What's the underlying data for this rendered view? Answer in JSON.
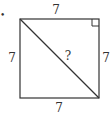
{
  "diagram": {
    "shape": "square",
    "sides": {
      "top": "7",
      "left": "7",
      "right": "7",
      "bottom": "7"
    },
    "diagonal_label": "?",
    "right_angle_marker": "top-right",
    "bullet": "•"
  }
}
